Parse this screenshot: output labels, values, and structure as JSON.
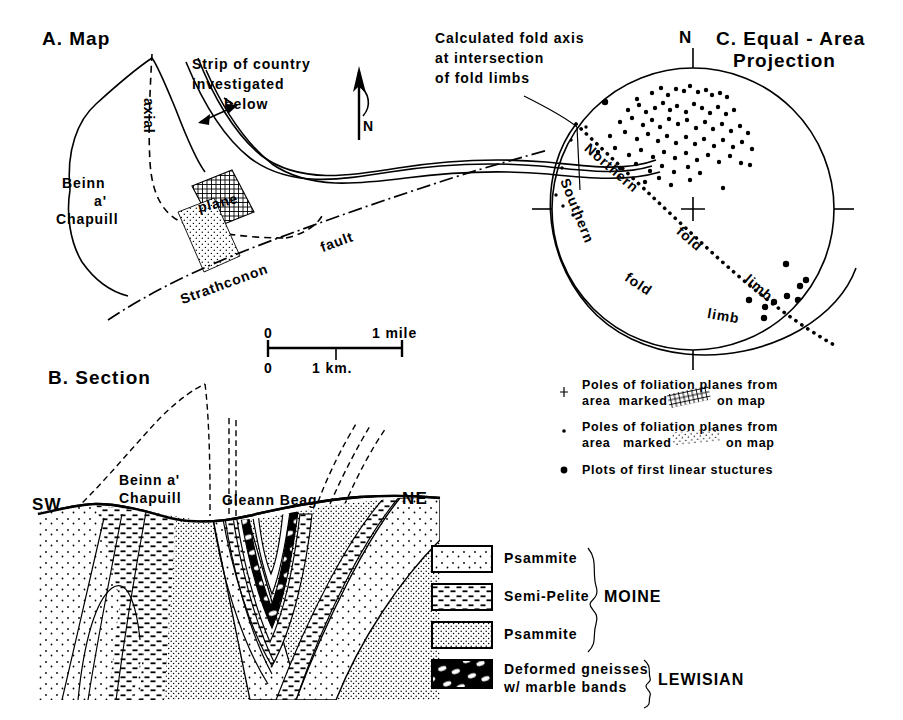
{
  "figure": {
    "caption_domain": "geological figure: map, cross-section and stereographic projection"
  },
  "panel_a": {
    "title": "A. Map",
    "strip_label_line1": "Strip of country",
    "strip_label_line2": "investigated",
    "strip_label_line3": "below",
    "north_label": "N",
    "axial_label": "axial",
    "plane_label": "plane",
    "locality_line1": "Beinn",
    "locality_line2": "a'",
    "locality_line3": "Chapuill",
    "fault_label": "Strathconon",
    "fault_label2": "fault",
    "scale": {
      "top_left": "0",
      "top_right": "1 mile",
      "bottom_left": "0",
      "bottom_mid": "1 km."
    }
  },
  "panel_b": {
    "title": "B. Section",
    "left_direction": "SW",
    "right_direction": "NE",
    "peak_label_line1": "Beinn a'",
    "peak_label_line2": "Chapuill",
    "valley_label": "Gleann Beag"
  },
  "panel_c": {
    "title_line1": "C. Equal - Area",
    "title_line2": "Projection",
    "north_label": "N",
    "callout_line1": "Calculated fold axis",
    "callout_line2": "at intersection",
    "callout_line3": "of fold limbs",
    "northern_limb_line1": "Northern",
    "northern_limb_line2": "fold",
    "northern_limb_line3": "limb",
    "southern_limb_line1": "Southern",
    "southern_limb_line2": "fold",
    "southern_limb_line3": "limb",
    "legend": [
      {
        "marker": "cross-marker",
        "line1_a": "Poles of foliation planes from",
        "line2_a": "area  marked",
        "swatch": "crosshatch-swatch",
        "line2_b": "on map"
      },
      {
        "marker": "small-dot-marker",
        "line1_a": "Poles of foliation planes from",
        "line2_a": "area   marked",
        "swatch": "stipple-swatch",
        "line2_b": "on map"
      },
      {
        "marker": "large-dot-marker",
        "line1_a": "Plots of first linear stuctures",
        "line2_a": "",
        "swatch": "",
        "line2_b": ""
      }
    ]
  },
  "rock_legend": {
    "items": [
      {
        "pattern": "sparse-dot-pattern",
        "label": "Psammite"
      },
      {
        "pattern": "dash-pattern",
        "label": "Semi-Pelite"
      },
      {
        "pattern": "dense-dot-pattern",
        "label": "Psammite"
      },
      {
        "pattern": "gneiss-marble-pattern",
        "label_line1": "Deformed gneisses",
        "label_line2": "w/ marble bands"
      }
    ],
    "group_moine": "MOINE",
    "group_lewisian": "LEWISIAN"
  },
  "colors": {
    "ink": "#000000",
    "paper": "#ffffff"
  },
  "chart_data": {
    "type": "scatter",
    "projection": "equal-area lower hemisphere stereonet",
    "center": [
      693,
      209
    ],
    "radius": 142,
    "ticks": [
      "N",
      "E",
      "S",
      "W"
    ],
    "great_circles": [
      {
        "name": "Northern fold limb",
        "style": "dotted"
      },
      {
        "name": "Southern fold limb",
        "style": "solid"
      }
    ],
    "fold_axis_intersection": [
      577,
      128
    ],
    "series": [
      {
        "name": "Poles of foliation planes from crosshatched area",
        "marker": "dot",
        "points": [
          [
            637,
            99
          ],
          [
            652,
            93
          ],
          [
            661,
            88
          ],
          [
            668,
            95
          ],
          [
            676,
            89
          ],
          [
            684,
            91
          ],
          [
            690,
            86
          ],
          [
            698,
            92
          ],
          [
            706,
            90
          ],
          [
            712,
            95
          ],
          [
            720,
            93
          ],
          [
            727,
            97
          ],
          [
            628,
            110
          ],
          [
            639,
            105
          ],
          [
            646,
            112
          ],
          [
            655,
            108
          ],
          [
            663,
            103
          ],
          [
            670,
            110
          ],
          [
            677,
            106
          ],
          [
            686,
            112
          ],
          [
            694,
            104
          ],
          [
            702,
            108
          ],
          [
            710,
            113
          ],
          [
            718,
            107
          ],
          [
            726,
            114
          ],
          [
            734,
            110
          ],
          [
            620,
            122
          ],
          [
            632,
            118
          ],
          [
            643,
            125
          ],
          [
            652,
            120
          ],
          [
            660,
            127
          ],
          [
            669,
            119
          ],
          [
            678,
            124
          ],
          [
            687,
            120
          ],
          [
            696,
            128
          ],
          [
            705,
            122
          ],
          [
            713,
            129
          ],
          [
            722,
            124
          ],
          [
            731,
            131
          ],
          [
            740,
            126
          ],
          [
            748,
            133
          ],
          [
            610,
            136
          ],
          [
            625,
            132
          ],
          [
            637,
            139
          ],
          [
            648,
            134
          ],
          [
            658,
            141
          ],
          [
            667,
            136
          ],
          [
            676,
            143
          ],
          [
            686,
            137
          ],
          [
            695,
            144
          ],
          [
            704,
            139
          ],
          [
            714,
            146
          ],
          [
            723,
            140
          ],
          [
            733,
            147
          ],
          [
            742,
            142
          ],
          [
            752,
            149
          ],
          [
            598,
            152
          ],
          [
            615,
            148
          ],
          [
            629,
            155
          ],
          [
            641,
            150
          ],
          [
            653,
            157
          ],
          [
            664,
            152
          ],
          [
            675,
            158
          ],
          [
            686,
            153
          ],
          [
            697,
            160
          ],
          [
            708,
            155
          ],
          [
            719,
            162
          ],
          [
            730,
            156
          ],
          [
            741,
            163
          ],
          [
            620,
            168
          ],
          [
            636,
            164
          ],
          [
            650,
            171
          ],
          [
            662,
            166
          ],
          [
            674,
            172
          ],
          [
            688,
            167
          ],
          [
            700,
            173
          ],
          [
            645,
            182
          ],
          [
            659,
            178
          ],
          [
            671,
            185
          ],
          [
            690,
            180
          ],
          [
            723,
            188
          ],
          [
            750,
            165
          ]
        ]
      },
      {
        "name": "Poles of foliation planes from stippled area",
        "marker": "small-dot",
        "points": [
          [
            558,
            120
          ],
          [
            566,
            115
          ],
          [
            572,
            124
          ],
          [
            580,
            118
          ],
          [
            586,
            127
          ],
          [
            563,
            134
          ],
          [
            571,
            140
          ],
          [
            556,
            146
          ],
          [
            553,
            161
          ],
          [
            562,
            168
          ],
          [
            548,
            176
          ],
          [
            556,
            195
          ],
          [
            563,
            206
          ],
          [
            573,
            215
          ],
          [
            570,
            95
          ],
          [
            585,
            108
          ]
        ]
      },
      {
        "name": "Plots of first linear structures",
        "marker": "large-dot",
        "points": [
          [
            605,
            102
          ],
          [
            786,
            264
          ],
          [
            800,
            286
          ],
          [
            806,
            280
          ],
          [
            812,
            292
          ],
          [
            798,
            300
          ],
          [
            787,
            296
          ],
          [
            774,
            302
          ],
          [
            765,
            307
          ],
          [
            816,
            302
          ],
          [
            805,
            312
          ],
          [
            764,
            318
          ],
          [
            749,
            300
          ]
        ]
      }
    ]
  }
}
